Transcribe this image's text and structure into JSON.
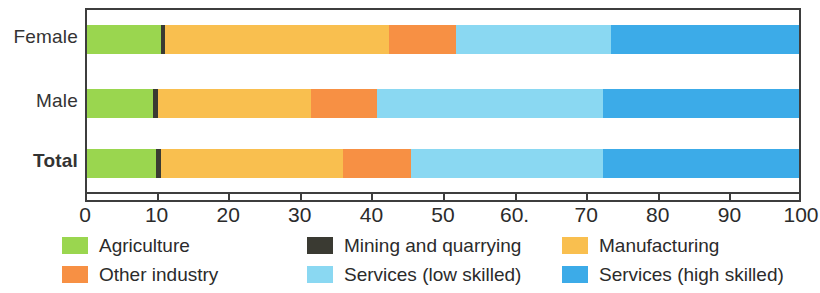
{
  "chart_data": {
    "type": "bar",
    "orientation": "horizontal",
    "stacked": true,
    "normalized_percent": true,
    "title": "",
    "subtitle": "",
    "xlabel": "",
    "ylabel": "",
    "xlim": [
      0,
      100
    ],
    "xticks": [
      0,
      10,
      20,
      30,
      40,
      50,
      60,
      70,
      80,
      90,
      100
    ],
    "xtick_labels": [
      "0",
      "10",
      "20",
      "30",
      "40",
      "50",
      "60.",
      "70",
      "80",
      "90",
      "100"
    ],
    "grid": false,
    "legend_position": "bottom",
    "categories": [
      "Female",
      "Male",
      "Total"
    ],
    "bold_categories": [
      "Total"
    ],
    "series": [
      {
        "name": "Agriculture",
        "color": "#9ad64f",
        "values": [
          10.4,
          9.3,
          9.7
        ]
      },
      {
        "name": "Mining and quarrying",
        "color": "#3a3a32",
        "values": [
          0.6,
          0.7,
          0.7
        ]
      },
      {
        "name": "Manufacturing",
        "color": "#f9bf4f",
        "values": [
          31.4,
          21.5,
          25.6
        ]
      },
      {
        "name": "Other industry",
        "color": "#f79044",
        "values": [
          9.4,
          9.2,
          9.5
        ]
      },
      {
        "name": "Services (low skilled)",
        "color": "#8ad8f2",
        "values": [
          21.8,
          31.8,
          27.0
        ]
      },
      {
        "name": "Services (high skilled)",
        "color": "#3cabe8",
        "values": [
          26.4,
          27.5,
          27.5
        ]
      }
    ]
  },
  "axis": {
    "tick_labels": [
      "0",
      "10",
      "20",
      "30",
      "40",
      "50",
      "60.",
      "70",
      "80",
      "90",
      "100"
    ]
  },
  "categories": {
    "female": "Female",
    "male": "Male",
    "total": "Total"
  },
  "legend": {
    "items": [
      {
        "label": "Agriculture",
        "color": "#9ad64f"
      },
      {
        "label": "Mining and quarrying",
        "color": "#3a3a32"
      },
      {
        "label": "Manufacturing",
        "color": "#f9bf4f"
      },
      {
        "label": "Other industry",
        "color": "#f79044"
      },
      {
        "label": "Services (low skilled)",
        "color": "#8ad8f2"
      },
      {
        "label": "Services (high skilled)",
        "color": "#3cabe8"
      }
    ]
  },
  "colors": {
    "frame": "#3d3d3d",
    "background": "#ffffff",
    "text": "#2b2b2b"
  }
}
